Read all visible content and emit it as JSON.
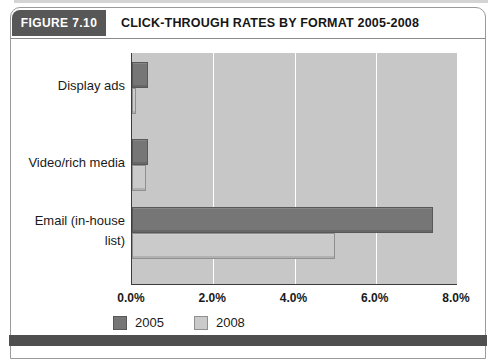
{
  "figure": {
    "label": "FIGURE 7.10",
    "title": "CLICK-THROUGH RATES BY FORMAT 2005-2008"
  },
  "chart_data": {
    "type": "bar",
    "orientation": "horizontal",
    "title": "CLICK-THROUGH RATES BY FORMAT 2005-2008",
    "categories": [
      "Display ads",
      "Video/rich media",
      "Email (in-house list)"
    ],
    "series": [
      {
        "name": "2005",
        "values": [
          0.4,
          0.4,
          7.4
        ],
        "color": "#767676",
        "border_color": "#585858"
      },
      {
        "name": "2008",
        "values": [
          0.1,
          0.35,
          5.0
        ],
        "color": "#cacaca",
        "border_color": "#8f8f8f"
      }
    ],
    "unit": "%",
    "xlim": [
      0,
      8
    ],
    "x_tick_values": [
      0,
      2,
      4,
      6,
      8
    ],
    "x_tick_labels": [
      "0.0%",
      "2.0%",
      "4.0%",
      "6.0%",
      "8.0%"
    ],
    "gridline_values": [
      2,
      4,
      6
    ],
    "gridline_color": "#ffffff",
    "plot_bg": "#c7c7c7",
    "legend_position": "bottom-left",
    "colors": {
      "accent_dark": "#575757",
      "bottom_rule": "#4f4f4f",
      "axis_line": "#3c3c3c"
    }
  }
}
